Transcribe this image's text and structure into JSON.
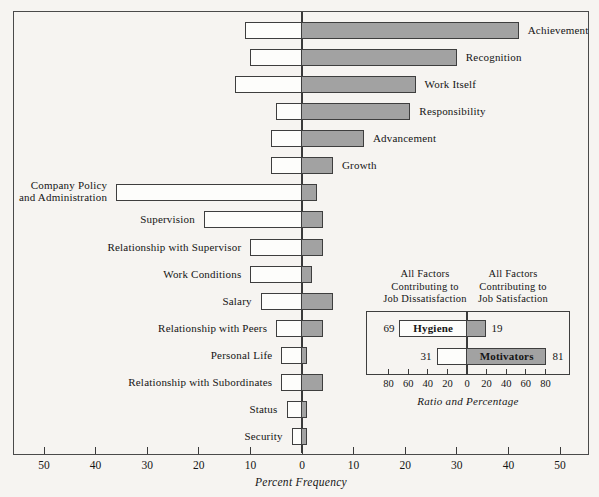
{
  "colors": {
    "background": "#f6f4f1",
    "bar_fill_gray": "#a2a2a2",
    "bar_fill_white": "#fdfdfb",
    "outline": "#3e3e3e"
  },
  "chart_data": {
    "type": "bar",
    "orientation": "horizontal-diverging",
    "xlabel": "Percent Frequency",
    "x_axis_tick_labels": [
      50,
      40,
      30,
      20,
      10,
      0,
      10,
      20,
      30,
      40,
      50
    ],
    "x_axis_units_range": [
      -56,
      56
    ],
    "grid": false,
    "categories": [
      "Achievement",
      "Recognition",
      "Work Itself",
      "Responsibility",
      "Advancement",
      "Growth",
      "Company Policy\nand Administration",
      "Supervision",
      "Relationship with Supervisor",
      "Work Conditions",
      "Salary",
      "Relationship with Peers",
      "Personal Life",
      "Relationship with Subordinates",
      "Status",
      "Security"
    ],
    "label_sides": [
      "right",
      "right",
      "right",
      "right",
      "right",
      "right",
      "left",
      "left",
      "left",
      "left",
      "left",
      "left",
      "left",
      "left",
      "left",
      "left"
    ],
    "series": [
      {
        "name": "Percent frequency in dissatisfaction events (white bars, left of zero)",
        "values": [
          11,
          10,
          13,
          5,
          6,
          6,
          36,
          19,
          10,
          10,
          8,
          5,
          4,
          4,
          3,
          2
        ]
      },
      {
        "name": "Percent frequency in satisfaction events (gray bars, right of zero)",
        "values": [
          42,
          30,
          22,
          21,
          12,
          6,
          3,
          4,
          4,
          2,
          6,
          4,
          1,
          4,
          1,
          1
        ]
      }
    ],
    "inset": {
      "header_left": "All Factors\nContributing to\nJob Dissatisfaction",
      "header_right": "All Factors\nContributing to\nJob Satisfaction",
      "rows": [
        {
          "label": "Hygiene",
          "label_in": "white",
          "left_value": 69,
          "right_value": 19
        },
        {
          "label": "Motivators",
          "label_in": "gray",
          "left_value": 31,
          "right_value": 81
        }
      ],
      "axis_tick_labels": [
        80,
        60,
        40,
        20,
        0,
        20,
        40,
        60,
        80
      ],
      "caption": "Ratio and Percentage"
    }
  }
}
